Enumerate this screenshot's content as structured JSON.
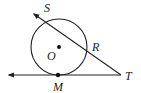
{
  "diagram": {
    "stroke_color": "#222222",
    "background": "#ffffff",
    "labels": {
      "S": "S",
      "R": "R",
      "O": "O",
      "M": "M",
      "T": "T"
    },
    "circle": {
      "center": "O",
      "cx": 59,
      "cy": 47,
      "r": 28
    },
    "points": [
      {
        "name": "O",
        "x": 59,
        "y": 47,
        "dot": true
      },
      {
        "name": "M",
        "x": 58,
        "y": 75,
        "dot": true
      },
      {
        "name": "R",
        "x": 86,
        "y": 52,
        "dot": false
      },
      {
        "name": "S",
        "x": 43,
        "y": 22,
        "dot": false
      },
      {
        "name": "T",
        "x": 121,
        "y": 75,
        "dot": false
      }
    ],
    "lines": [
      {
        "type": "ray",
        "from": "T",
        "through": "M",
        "arrow": "left",
        "role": "tangent"
      },
      {
        "type": "ray",
        "from": "T",
        "through": "R",
        "arrow": "upper-left",
        "role": "secant"
      }
    ]
  }
}
